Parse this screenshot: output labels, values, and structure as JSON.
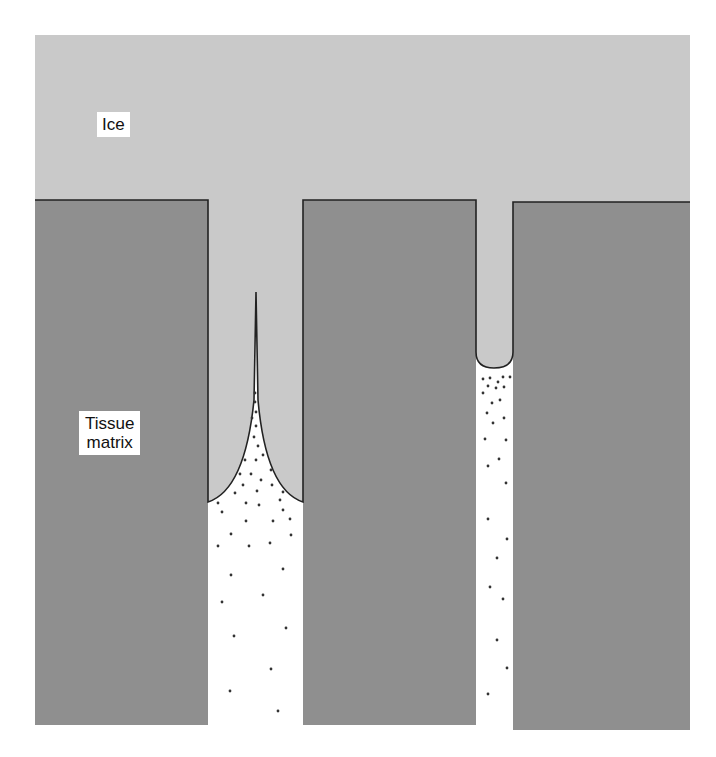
{
  "figure": {
    "labels": {
      "ice": "Ice",
      "tissue_line1": "Tissue",
      "tissue_line2": "matrix"
    },
    "colors": {
      "ice": "#c9c9c9",
      "tissue": "#8f8f8f",
      "channel": "#ffffff",
      "outline": "#222222",
      "solute_dot": "#333333"
    },
    "regions": [
      "Ice",
      "Tissue matrix",
      "Extracellular channel (wide)",
      "Extracellular channel (narrow)"
    ]
  }
}
